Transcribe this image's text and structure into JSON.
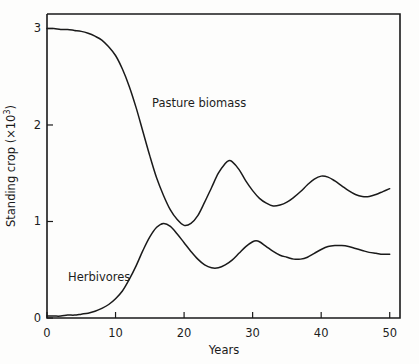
{
  "chart_data": {
    "type": "line",
    "title": "",
    "xlabel": "Years",
    "ylabel_text": "Standing crop (×10",
    "ylabel_exponent": "3",
    "ylabel_tail": ")",
    "ylabel_full": "Standing crop (×10³)",
    "xlim": [
      0,
      51.5
    ],
    "ylim": [
      0,
      3.15
    ],
    "xticks": [
      0,
      10,
      20,
      30,
      40,
      50
    ],
    "xtick_labels": [
      "0",
      "10",
      "20",
      "30",
      "40",
      "50"
    ],
    "yticks": [
      0,
      1,
      2,
      3
    ],
    "ytick_labels": [
      "0",
      "1",
      "2",
      "3"
    ],
    "grid": false,
    "legend_position": "inline-annotations",
    "line_color": "#1a1a1a",
    "frame_color": "#1a1a1a",
    "background_color": "#fdfdfc",
    "series": [
      {
        "name": "Pasture biomass",
        "label_x": 22,
        "label_y": 2.3,
        "x": [
          0,
          1,
          2,
          3,
          4,
          5,
          6,
          7,
          8,
          9,
          10,
          11,
          12,
          13,
          14,
          15,
          16,
          17,
          18,
          19,
          20,
          21,
          22,
          23,
          24,
          25,
          26,
          26.5,
          27,
          28,
          29,
          30,
          31,
          32,
          33,
          34,
          35,
          36,
          37,
          38,
          39,
          40,
          41,
          42,
          43,
          44,
          45,
          46,
          47,
          48,
          49,
          50
        ],
        "values": [
          3.0,
          3.0,
          2.99,
          2.99,
          2.98,
          2.97,
          2.95,
          2.92,
          2.88,
          2.81,
          2.72,
          2.58,
          2.4,
          2.18,
          1.93,
          1.68,
          1.45,
          1.27,
          1.12,
          1.02,
          0.96,
          0.98,
          1.06,
          1.2,
          1.35,
          1.5,
          1.6,
          1.63,
          1.62,
          1.54,
          1.42,
          1.32,
          1.24,
          1.19,
          1.16,
          1.17,
          1.2,
          1.25,
          1.31,
          1.38,
          1.44,
          1.47,
          1.46,
          1.42,
          1.37,
          1.32,
          1.28,
          1.26,
          1.26,
          1.28,
          1.31,
          1.34
        ]
      },
      {
        "name": "Herbivores",
        "label_x": 5,
        "label_y": 0.48,
        "x": [
          0,
          1,
          2,
          3,
          4,
          5,
          6,
          7,
          8,
          9,
          10,
          11,
          12,
          13,
          14,
          15,
          16,
          17,
          18,
          19,
          20,
          21,
          22,
          23,
          24,
          25,
          26,
          27,
          28,
          29,
          30,
          30.5,
          31,
          32,
          33,
          34,
          35,
          36,
          37,
          38,
          39,
          40,
          41,
          42,
          43,
          44,
          45,
          46,
          47,
          48,
          49,
          50
        ],
        "values": [
          0.02,
          0.02,
          0.02,
          0.03,
          0.03,
          0.04,
          0.05,
          0.07,
          0.1,
          0.14,
          0.2,
          0.28,
          0.4,
          0.54,
          0.7,
          0.84,
          0.94,
          0.98,
          0.95,
          0.87,
          0.78,
          0.69,
          0.61,
          0.55,
          0.52,
          0.52,
          0.55,
          0.6,
          0.67,
          0.74,
          0.79,
          0.8,
          0.79,
          0.74,
          0.69,
          0.65,
          0.63,
          0.61,
          0.61,
          0.63,
          0.67,
          0.71,
          0.74,
          0.75,
          0.75,
          0.74,
          0.72,
          0.7,
          0.68,
          0.67,
          0.66,
          0.66
        ]
      }
    ],
    "annotations": [
      {
        "text": "Pasture biomass",
        "name": "pasture-biomass-label"
      },
      {
        "text": "Herbivores",
        "name": "herbivores-label"
      }
    ]
  }
}
